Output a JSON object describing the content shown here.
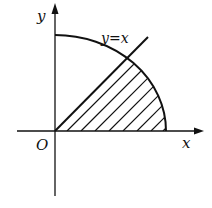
{
  "diagram": {
    "labels": {
      "y_axis": "y",
      "x_axis": "x",
      "origin": "O",
      "line": "y=x"
    },
    "colors": {
      "stroke": "#111111",
      "background": "#ffffff"
    },
    "shaded_region": "area under arc bounded by y=x and x-axis (0 ≤ θ ≤ π/4)",
    "hatch_style": "diagonal lines parallel to y=x"
  }
}
